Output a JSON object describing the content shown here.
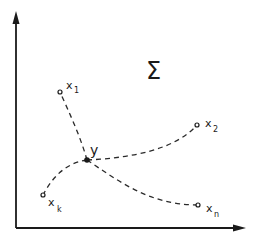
{
  "diagram": {
    "set_label": "Σ",
    "colors": {
      "ink": "#1a1a1a",
      "background": "#ffffff"
    },
    "axes": {
      "x_axis": "horizontal-arrow",
      "y_axis": "vertical-arrow"
    },
    "center_point": {
      "label": "y",
      "x": 87,
      "y": 160
    },
    "points": [
      {
        "id": "x1",
        "label_base": "x",
        "label_sub": "1",
        "x": 60,
        "y": 92
      },
      {
        "id": "x2",
        "label_base": "x",
        "label_sub": "2",
        "x": 197,
        "y": 125
      },
      {
        "id": "xk",
        "label_base": "x",
        "label_sub": "k",
        "x": 43,
        "y": 195
      },
      {
        "id": "xn",
        "label_base": "x",
        "label_sub": "n",
        "x": 198,
        "y": 205
      }
    ]
  }
}
